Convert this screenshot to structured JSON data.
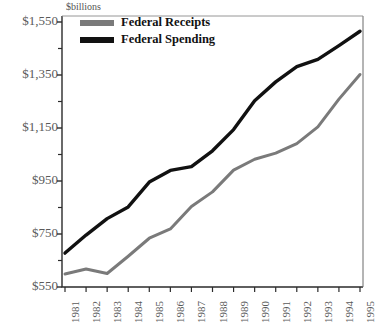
{
  "chart_data": {
    "type": "line",
    "title": "",
    "subtitle": "",
    "xlabel": "",
    "ylabel": "$billions",
    "axis_unit_label": "$billions",
    "categories": [
      "1981",
      "1982",
      "1983",
      "1984",
      "1985",
      "1986",
      "1987",
      "1988",
      "1989",
      "1990",
      "1991",
      "1992",
      "1993",
      "1994",
      "1995"
    ],
    "ylim": [
      550,
      1550
    ],
    "xlim_labels": [
      "1981",
      "1995"
    ],
    "ytick_labels": [
      "$550",
      "$750",
      "$950",
      "$1,150",
      "$1,350",
      "$1,550"
    ],
    "ytick_values": [
      550,
      750,
      950,
      1150,
      1350,
      1550
    ],
    "yminor_tick_values": [
      650,
      850,
      1050,
      1250,
      1450
    ],
    "grid": false,
    "legend_position": "top-left",
    "series": [
      {
        "name": "Federal Receipts",
        "color": "#7a7a7a",
        "values": [
          599,
          618,
          601,
          666,
          734,
          769,
          854,
          909,
          991,
          1032,
          1055,
          1091,
          1154,
          1259,
          1352
        ]
      },
      {
        "name": "Federal Spending",
        "color": "#111111",
        "values": [
          678,
          746,
          808,
          852,
          946,
          990,
          1004,
          1064,
          1144,
          1253,
          1324,
          1382,
          1409,
          1461,
          1515
        ]
      }
    ]
  },
  "legend": {
    "items": [
      {
        "label": "Federal Receipts",
        "color": "#7a7a7a"
      },
      {
        "label": "Federal Spending",
        "color": "#111111"
      }
    ]
  }
}
